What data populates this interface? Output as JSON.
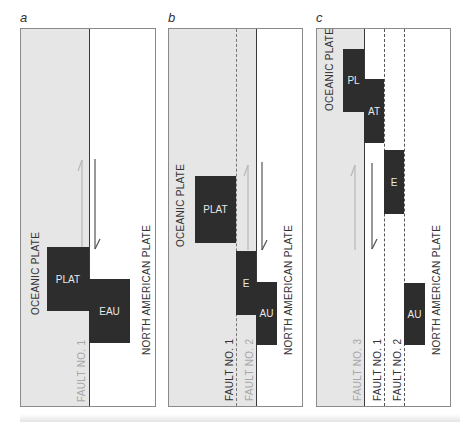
{
  "figure": {
    "panels": [
      {
        "letter": "a",
        "oceanic_label": "OCEANIC PLATE",
        "continental_label": "NORTH AMERICAN PLATE",
        "faults": [
          {
            "label": "FAULT NO. 1",
            "style": "solid"
          }
        ],
        "blocks": [
          "PLAT",
          "EAU"
        ]
      },
      {
        "letter": "b",
        "oceanic_label": "OCEANIC PLATE",
        "continental_label": "NORTH AMERICAN PLATE",
        "faults": [
          {
            "label": "FAULT NO. 1",
            "style": "dashed"
          },
          {
            "label": "FAULT NO. 2",
            "style": "solid"
          }
        ],
        "blocks": [
          "PLAT",
          "E",
          "AU"
        ]
      },
      {
        "letter": "c",
        "oceanic_label": "OCEANIC PLATE",
        "continental_label": "NORTH AMERICAN PLATE",
        "faults": [
          {
            "label": "FAULT NO. 3",
            "style": "solid"
          },
          {
            "label": "FAULT NO. 1",
            "style": "dashed"
          },
          {
            "label": "FAULT NO. 2",
            "style": "dashed"
          }
        ],
        "blocks": [
          "PL",
          "AT",
          "E",
          "AU"
        ]
      }
    ],
    "colors": {
      "oceanic_fill": "#e6e6e6",
      "block_fill": "#2d2d2d",
      "block_text": "#e8e8e8",
      "border": "#8a8a8a"
    }
  }
}
